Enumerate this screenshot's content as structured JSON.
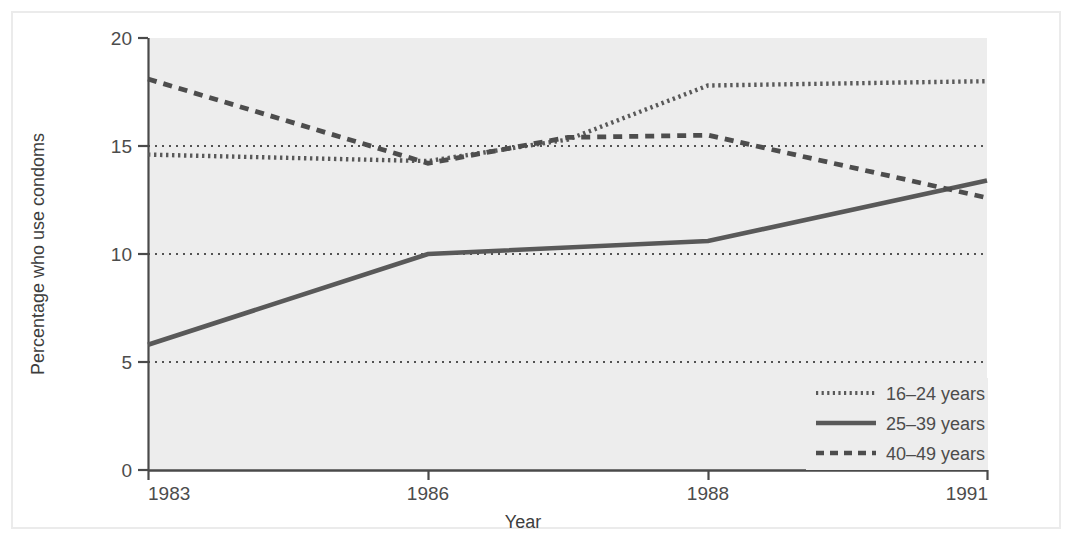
{
  "chart_data": {
    "type": "line",
    "title": "",
    "xlabel": "Year",
    "ylabel": "Percentage who use condoms",
    "x": [
      1983,
      1986,
      1988,
      1991
    ],
    "xtick_labels": [
      "1983",
      "1986",
      "1988",
      "1991"
    ],
    "ytick_labels": [
      "0",
      "5",
      "10",
      "15",
      "20"
    ],
    "ytick_values": [
      0,
      5,
      10,
      15,
      20
    ],
    "ylim": [
      0,
      20
    ],
    "grid": "horizontal dotted gridlines at 5, 10, 15",
    "legend_position": "bottom-right inside plot",
    "plot_background": "#ededed",
    "series": [
      {
        "name": "16–24 years",
        "style": "dotted",
        "color": "#595959",
        "values": [
          14.6,
          14.3,
          17.8,
          18.0
        ],
        "points": [
          {
            "x": 1983,
            "y": 14.6
          },
          {
            "x": 1986,
            "y": 14.3
          },
          {
            "x": 1987,
            "y": 15.3
          },
          {
            "x": 1988,
            "y": 17.8
          },
          {
            "x": 1991,
            "y": 18.0
          }
        ]
      },
      {
        "name": "25–39 years",
        "style": "solid",
        "color": "#595959",
        "values": [
          5.8,
          10.0,
          10.6,
          13.4
        ],
        "points": [
          {
            "x": 1983,
            "y": 5.8
          },
          {
            "x": 1986,
            "y": 10.0
          },
          {
            "x": 1988,
            "y": 10.6
          },
          {
            "x": 1991,
            "y": 13.4
          }
        ]
      },
      {
        "name": "40–49 years",
        "style": "dashed",
        "color": "#4d4d4d",
        "values": [
          18.1,
          14.2,
          15.5,
          12.6
        ],
        "points": [
          {
            "x": 1983,
            "y": 18.1
          },
          {
            "x": 1986,
            "y": 14.2
          },
          {
            "x": 1987,
            "y": 15.4
          },
          {
            "x": 1988,
            "y": 15.5
          },
          {
            "x": 1991,
            "y": 12.6
          }
        ]
      }
    ]
  },
  "axes": {
    "y_title": "Percentage who use condoms",
    "x_title": "Year",
    "y_ticks": [
      "20",
      "15",
      "10",
      "5",
      "0"
    ],
    "x_ticks": [
      "1983",
      "1986",
      "1988",
      "1991"
    ]
  },
  "legend": {
    "entries": [
      {
        "label": "16–24 years",
        "marker": "dotted-line-swatch"
      },
      {
        "label": "25–39 years",
        "marker": "solid-line-swatch"
      },
      {
        "label": "40–49 years",
        "marker": "dashed-line-swatch"
      }
    ]
  },
  "colors": {
    "plot_background": "#ededed",
    "axis": "#4a4a4a",
    "series_line": "#595959",
    "gridline": "#1a1a1a",
    "frame": "#ebebeb",
    "text": "#4c4c4c"
  }
}
